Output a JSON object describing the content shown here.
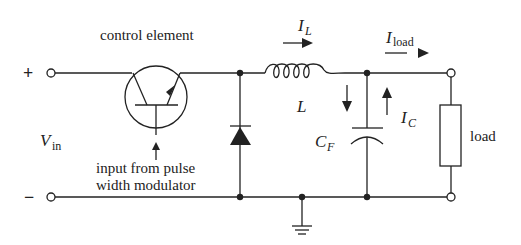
{
  "diagram": {
    "type": "circuit-schematic",
    "labels": {
      "control_element": "control element",
      "plus": "+",
      "minus": "−",
      "vin_main": "V",
      "vin_sub": "in",
      "pwm_line1": "input from pulse",
      "pwm_line2": "width modulator",
      "il_main": "I",
      "il_sub": "L",
      "iload_main": "I",
      "iload_sub": "load",
      "inductor": "L",
      "cf_main": "C",
      "cf_sub": "F",
      "ic_main": "I",
      "ic_sub": "C",
      "load": "load"
    },
    "components": [
      {
        "id": "transistor",
        "label": "control element"
      },
      {
        "id": "diode",
        "label": ""
      },
      {
        "id": "inductor",
        "label": "L"
      },
      {
        "id": "capacitor",
        "label": "C_F"
      },
      {
        "id": "load-resistor",
        "label": "load"
      },
      {
        "id": "ground",
        "label": ""
      }
    ],
    "colors": {
      "line": "#222222",
      "background": "#ffffff"
    }
  }
}
